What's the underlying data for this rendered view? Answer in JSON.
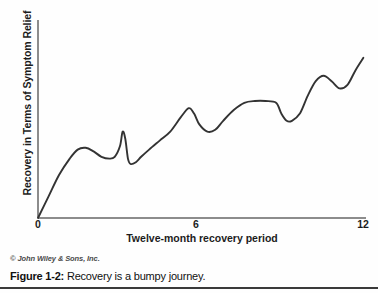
{
  "figure": {
    "credit": "© John Wiley & Sons, Inc.",
    "caption_label": "Figure 1-2:",
    "caption_text": " Recovery is a bumpy journey."
  },
  "chart_data": {
    "type": "line",
    "title": "",
    "subtitle": "",
    "xlabel": "Twelve-month recovery period",
    "ylabel": "Recovery in Terms of Symptom Relief",
    "xlim": [
      0,
      12.4
    ],
    "ylim": [
      0,
      100
    ],
    "xticks": [
      0,
      6,
      12
    ],
    "xticklabels": [
      "0",
      "6",
      "12"
    ],
    "yticks": [],
    "yticklabels": [],
    "grid": false,
    "legend": false,
    "line_color": "#333333",
    "axis_color": "#8c8c8c",
    "series": [
      {
        "name": "Recovery trajectory",
        "x": [
          0.0,
          0.4,
          0.8,
          1.2,
          1.5,
          1.8,
          2.1,
          2.4,
          2.7,
          2.9,
          3.1,
          3.2,
          3.3,
          3.4,
          3.5,
          3.7,
          3.9,
          4.2,
          4.6,
          5.0,
          5.4,
          5.7,
          5.9,
          6.1,
          6.4,
          6.7,
          7.0,
          7.4,
          7.8,
          8.2,
          8.6,
          9.0,
          9.2,
          9.4,
          9.6,
          9.9,
          10.2,
          10.5,
          10.8,
          11.1,
          11.4,
          11.7,
          12.0,
          12.3
        ],
        "y": [
          0,
          12,
          24,
          33,
          38,
          39,
          37,
          34,
          33,
          34,
          40,
          48,
          44,
          33,
          30,
          31,
          34,
          38,
          43,
          48,
          56,
          61,
          58,
          52,
          48,
          49,
          54,
          60,
          64,
          65,
          65,
          64,
          58,
          54,
          54,
          58,
          68,
          76,
          79,
          76,
          72,
          74,
          82,
          89
        ]
      }
    ],
    "annotations": []
  }
}
